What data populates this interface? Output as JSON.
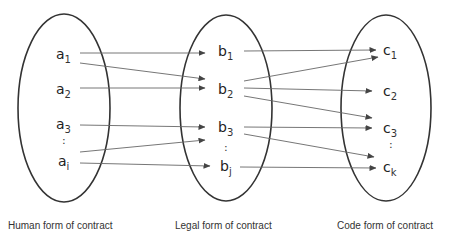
{
  "sets": [
    {
      "id": "A",
      "caption": "Human form of contract",
      "elements": [
        {
          "id": "a1",
          "base": "a",
          "sub": "1"
        },
        {
          "id": "a2",
          "base": "a",
          "sub": "2"
        },
        {
          "id": "a3",
          "base": "a",
          "sub": "3"
        },
        {
          "id": "ai",
          "base": "a",
          "sub": "i"
        }
      ],
      "ellipsis": ":"
    },
    {
      "id": "B",
      "caption": "Legal form of contract",
      "elements": [
        {
          "id": "b1",
          "base": "b",
          "sub": "1"
        },
        {
          "id": "b2",
          "base": "b",
          "sub": "2"
        },
        {
          "id": "b3",
          "base": "b",
          "sub": "3"
        },
        {
          "id": "bj",
          "base": "b",
          "sub": "j"
        }
      ],
      "ellipsis": ":"
    },
    {
      "id": "C",
      "caption": "Code form of contract",
      "elements": [
        {
          "id": "c1",
          "base": "c",
          "sub": "1"
        },
        {
          "id": "c2",
          "base": "c",
          "sub": "2"
        },
        {
          "id": "c3",
          "base": "c",
          "sub": "3"
        },
        {
          "id": "ck",
          "base": "c",
          "sub": "k"
        }
      ],
      "ellipsis": ":"
    }
  ],
  "mappings_A_to_B": [
    {
      "from": "a1",
      "to": "b1"
    },
    {
      "from": "a1",
      "to": "b2"
    },
    {
      "from": "a2",
      "to": "b2"
    },
    {
      "from": "a3",
      "to": "b3"
    },
    {
      "from": "ai",
      "to": "b3"
    },
    {
      "from": "ai",
      "to": "bj"
    }
  ],
  "mappings_B_to_C": [
    {
      "from": "b1",
      "to": "c1"
    },
    {
      "from": "b2",
      "to": "c1"
    },
    {
      "from": "b2",
      "to": "c2"
    },
    {
      "from": "b2",
      "to": "c3"
    },
    {
      "from": "b3",
      "to": "c3"
    },
    {
      "from": "b3",
      "to": "ck"
    },
    {
      "from": "bj",
      "to": "ck"
    }
  ],
  "colors": {
    "stroke": "#333333",
    "arrow": "#555555",
    "text": "#222222"
  }
}
